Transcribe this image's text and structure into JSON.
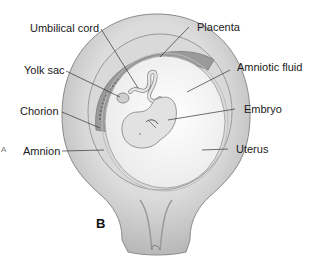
{
  "figure": {
    "panel_letter": "B",
    "prev_panel_fragment": "A",
    "labels": {
      "umbilical_cord": "Umbilical cord",
      "placenta": "Placenta",
      "yolk_sac": "Yolk sac",
      "amniotic_fluid": "Amniotic fluid",
      "chorion": "Chorion",
      "embryo": "Embryo",
      "amnion": "Amnion",
      "uterus": "Uterus"
    },
    "colors": {
      "uterus_wall": "#c8c8c8",
      "uterus_outline": "#8a8a8a",
      "chorion_layer": "#d9d9d9",
      "placenta": "#9a9a9a",
      "amniotic_fluid": "#f4f4f4",
      "embryo": "#e2e2e2",
      "leader_line": "#333333"
    }
  }
}
